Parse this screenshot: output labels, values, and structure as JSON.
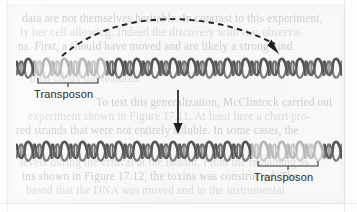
{
  "figure": {
    "background_color": "#fdfdfd",
    "paper_color": "#f8f8f7"
  },
  "ghost_text": {
    "note": "Faint text showing through from the reverse side of the scanned book page",
    "color": "#b9b6b4",
    "lines": [
      {
        "text": "data are not themselves heritable. In contrast to this experiment,",
        "x": 22,
        "y": 12
      },
      {
        "text": "ly her cell allowing. Indeed the discovery with two observa-",
        "x": 20,
        "y": 26
      },
      {
        "text": "ns. First, a should have moved and are likely a strong kind",
        "x": 18,
        "y": 40
      },
      {
        "text": "then clears the features.",
        "x": 30,
        "y": 72
      },
      {
        "text": "To test this generalization, McClintock carried out",
        "x": 96,
        "y": 96
      },
      {
        "text": "experiment shown in Figure 17.11. At least here a chart pro-",
        "x": 28,
        "y": 110
      },
      {
        "text": "red strands that were not entirely soluble. In some cases, the",
        "x": 16,
        "y": 124
      },
      {
        "text": "levels during the critical at the isolant. From the remaining as",
        "x": 20,
        "y": 156
      },
      {
        "text": "tns shown in Figure 17.12, the toxins was constructed. The",
        "x": 22,
        "y": 170
      },
      {
        "text": "based that the DNA was moved and to the instrumental",
        "x": 26,
        "y": 184
      }
    ]
  },
  "top_strand": {
    "name": "dna-strand-top",
    "x": 16,
    "y": 55,
    "width": 326,
    "unit_count": 18,
    "transposon_units": [
      1,
      2,
      3,
      4
    ],
    "dark_color": "#555558",
    "light_color": "#b5b5b7"
  },
  "bottom_strand": {
    "name": "dna-strand-bottom",
    "x": 16,
    "y": 138,
    "width": 326,
    "unit_count": 18,
    "transposon_units": [
      13,
      14,
      15,
      16
    ],
    "dark_color": "#555558",
    "light_color": "#b5b5b7"
  },
  "labels": {
    "top_transposon": {
      "text": "Transposon",
      "bracket_x": 37,
      "bracket_y": 78,
      "bracket_width": 62,
      "label_x": 34,
      "label_y": 88
    },
    "bottom_transposon": {
      "text": "Transposon",
      "bracket_x": 257,
      "bracket_y": 161,
      "bracket_width": 62,
      "label_x": 254,
      "label_y": 171
    }
  },
  "arrows": {
    "transposition_arc": {
      "name": "dashed-curved-arrow",
      "style": "dashed",
      "color": "#1f1f1f",
      "start_x": 62,
      "start_y": 56,
      "end_x": 279,
      "end_y": 54,
      "peak_y": 22
    },
    "time_arrow": {
      "name": "downward-arrow",
      "style": "solid",
      "color": "#1f1f1f",
      "x": 178,
      "start_y": 90,
      "end_y": 134
    }
  }
}
